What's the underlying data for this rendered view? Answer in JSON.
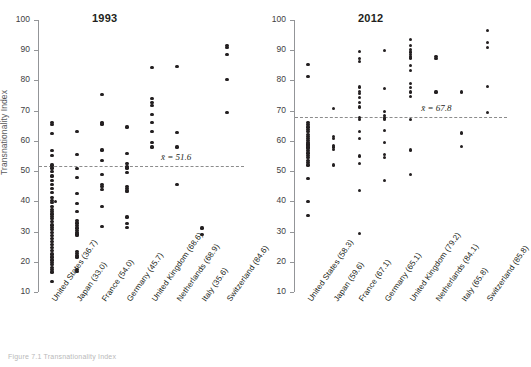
{
  "figure": {
    "ylabel": "Transnationality Index",
    "caption": "Figure 7.1  Transnationality Index",
    "y_ticks": [
      10,
      20,
      30,
      40,
      50,
      60,
      70,
      80,
      90,
      100
    ],
    "ylim": [
      10,
      100
    ]
  },
  "chart_data": {
    "type": "scatter",
    "title": "Transnationality Index",
    "xlabel": "",
    "ylabel": "Transnationality Index",
    "ylim": [
      10,
      100
    ],
    "yticks": [
      10,
      20,
      30,
      40,
      50,
      60,
      70,
      80,
      90,
      100
    ],
    "grid": false,
    "legend": "none",
    "panels": [
      {
        "title": "1993",
        "mean_label": "x̄ = 51.6",
        "mean_value": 51.6,
        "categories": [
          "United States (36.7)",
          "Japan (33.0)",
          "France (54.0)",
          "Germany (45.7)",
          "United Kingdom (68.6)",
          "Netherlands (68.9)",
          "Italy (35.6)",
          "Switzerland (84.6)"
        ],
        "series": [
          {
            "name": "United States (36.7)",
            "values": [
              66.0,
              65.5,
              62.4,
              56.8,
              55.2,
              52.0,
              51.0,
              49.8,
              48.4,
              47.0,
              45.6,
              44.2,
              42.8,
              41.4,
              40.2,
              40.0,
              39.6,
              38.4,
              37.4,
              36.6,
              35.8,
              35.0,
              34.2,
              33.2,
              32.2,
              31.4,
              30.6,
              29.6,
              28.6,
              27.6,
              26.6,
              25.6,
              24.6,
              23.6,
              22.6,
              21.6,
              20.6,
              19.8,
              19.0,
              18.2,
              17.4,
              16.6,
              13.6
            ]
          },
          {
            "name": "Japan (33.0)",
            "values": [
              63.0,
              55.4,
              50.8,
              48.0,
              42.5,
              39.2,
              36.6,
              33.6,
              32.8,
              32.0,
              31.2,
              30.4,
              29.8,
              29.2,
              28.6,
              23.4,
              22.8,
              22.2,
              21.6,
              17.4,
              16.8
            ]
          },
          {
            "name": "France (54.0)",
            "values": [
              75.4,
              66.2,
              65.6,
              57.0,
              53.4,
              49.0,
              45.6,
              45.0,
              44.0,
              38.2,
              31.8
            ]
          },
          {
            "name": "Germany (45.7)",
            "values": [
              64.6,
              55.8,
              52.4,
              51.6,
              51.0,
              49.6,
              45.0,
              44.2,
              43.6,
              43.2,
              34.8,
              32.6,
              31.4
            ]
          },
          {
            "name": "United Kingdom (68.6)",
            "values": [
              84.2,
              74.0,
              72.6,
              71.8,
              68.6,
              66.2,
              63.0,
              59.4,
              58.0
            ]
          },
          {
            "name": "Netherlands (68.9)",
            "values": [
              84.6,
              62.8,
              58.0,
              45.6
            ]
          },
          {
            "name": "Italy (35.6)",
            "values": [
              31.2,
              29.0
            ]
          },
          {
            "name": "Switzerland (84.6)",
            "values": [
              91.6,
              90.8,
              88.6,
              80.4,
              69.4
            ]
          }
        ]
      },
      {
        "title": "2012",
        "mean_label": "x̄ = 67.8",
        "mean_value": 67.8,
        "categories": [
          "United States (58.3)",
          "Japan (59.6)",
          "France (67.1)",
          "Germany (65.1)",
          "United Kingdom (79.2)",
          "Netherlands (84.1)",
          "Italy (65.8)",
          "Switzerland (85.8)"
        ],
        "series": [
          {
            "name": "United States (58.3)",
            "values": [
              85.2,
              81.2,
              66.2,
              65.4,
              64.6,
              63.8,
              63.0,
              62.2,
              61.4,
              60.8,
              60.2,
              59.6,
              59.0,
              58.6,
              58.0,
              57.4,
              56.8,
              56.0,
              55.2,
              54.4,
              53.6,
              52.8,
              52.0,
              47.6,
              40.0,
              35.2
            ]
          },
          {
            "name": "Japan (59.6)",
            "values": [
              70.6,
              61.4,
              60.8,
              58.6,
              58.0,
              57.2,
              52.0
            ]
          },
          {
            "name": "France (67.1)",
            "values": [
              89.6,
              87.2,
              86.4,
              77.8,
              76.4,
              75.6,
              74.4,
              72.6,
              71.2,
              67.8,
              67.2,
              63.2,
              60.8,
              55.0,
              52.4,
              43.6,
              29.4
            ]
          },
          {
            "name": "Germany (65.1)",
            "values": [
              90.0,
              77.4,
              69.6,
              68.4,
              67.6,
              67.2,
              63.4,
              59.4,
              55.4,
              54.4,
              47.0
            ]
          },
          {
            "name": "United Kingdom (79.2)",
            "values": [
              93.6,
              91.6,
              90.2,
              89.4,
              88.6,
              88.0,
              87.4,
              85.0,
              83.4,
              79.0,
              77.6,
              76.2,
              74.6,
              67.2,
              57.0,
              48.8
            ]
          },
          {
            "name": "Netherlands (84.1)",
            "values": [
              88.0,
              87.2,
              76.2
            ]
          },
          {
            "name": "Italy (65.8)",
            "values": [
              76.2,
              62.6,
              58.2
            ]
          },
          {
            "name": "Switzerland (85.8)",
            "values": [
              96.4,
              92.6,
              90.8,
              78.0,
              69.4
            ]
          }
        ]
      }
    ]
  }
}
